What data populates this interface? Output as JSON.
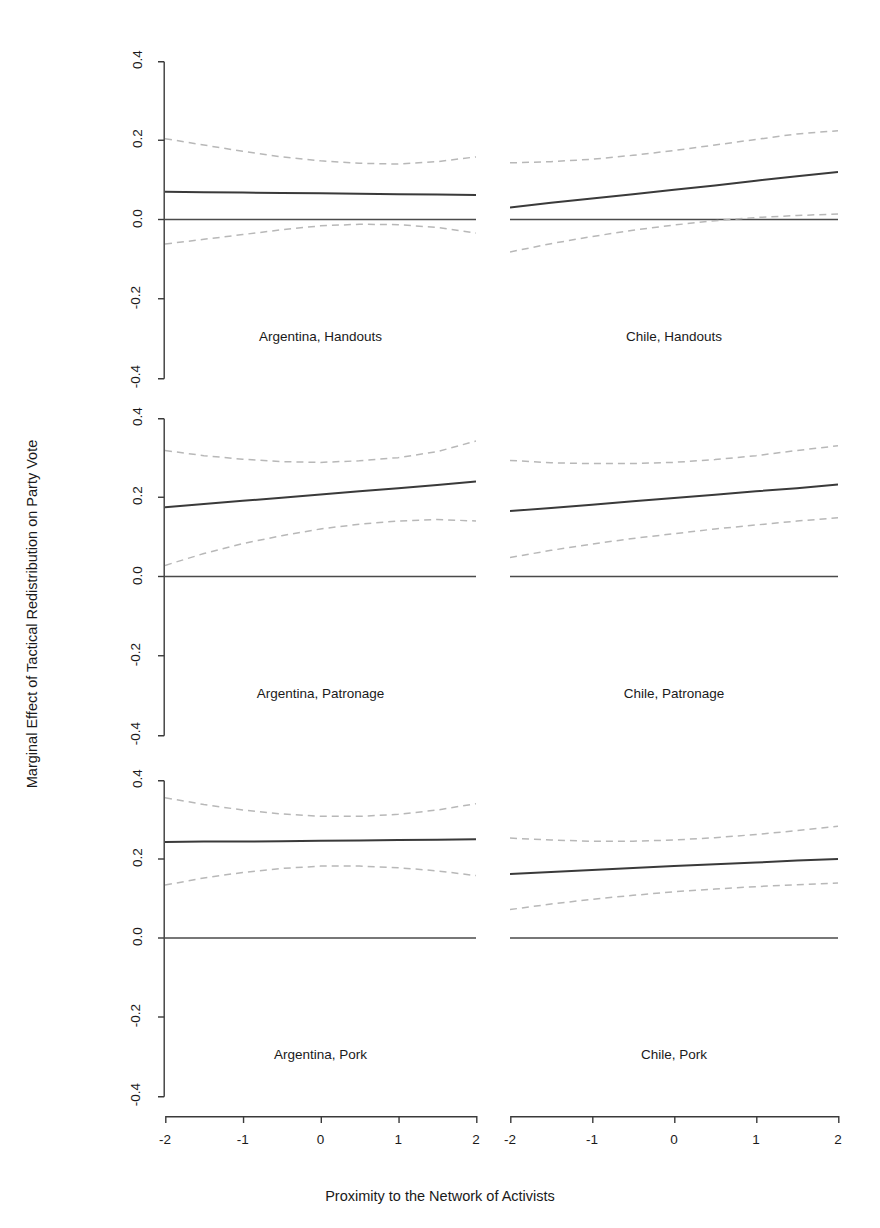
{
  "figure": {
    "clipped_top_text": "",
    "ylabel": "Marginal Effect of Tactical Redistribution on Party Vote",
    "xlabel": "Proximity to the Network of Activists"
  },
  "axes": {
    "y_tick_labels": [
      "0.4",
      "0.2",
      "0.0",
      "-0.2",
      "-0.4"
    ],
    "x_tick_labels": [
      "-2",
      "-1",
      "0",
      "1",
      "2"
    ]
  },
  "colors": {
    "estimate_line": "#3a3a3a",
    "ci_line": "#b8b8b8",
    "zero_line": "#4a4a4a",
    "axis": "#3a3a3a",
    "text": "#1a1a1a",
    "background": "#ffffff"
  },
  "chart_data": {
    "type": "line",
    "title": "",
    "xlabel": "Proximity to the Network of Activists",
    "ylabel": "Marginal Effect of Tactical Redistribution on Party Vote",
    "xlim": [
      -2,
      2
    ],
    "ylim": [
      -0.4,
      0.4
    ],
    "xticks": [
      -2,
      -1,
      0,
      1,
      2
    ],
    "yticks": [
      -0.4,
      -0.2,
      0.0,
      0.2,
      0.4
    ],
    "grid": false,
    "legend": "none",
    "layout": {
      "rows": 3,
      "cols": 2,
      "row_order": [
        "Handouts",
        "Patronage",
        "Pork"
      ],
      "col_order": [
        "Argentina",
        "Chile"
      ]
    },
    "reference_line": 0.0,
    "x": [
      -2,
      -1.5,
      -1,
      -0.5,
      0,
      0.5,
      1,
      1.5,
      2
    ],
    "panels": [
      {
        "label": "Argentina, Handouts",
        "country": "Argentina",
        "outcome": "Handouts",
        "row": 0,
        "col": 0,
        "series": [
          {
            "name": "Marginal effect",
            "style": "solid",
            "values": [
              0.07,
              0.069,
              0.068,
              0.067,
              0.066,
              0.065,
              0.064,
              0.063,
              0.062
            ]
          },
          {
            "name": "Upper 95% CI",
            "style": "dashed",
            "values": [
              0.204,
              0.188,
              0.172,
              0.158,
              0.148,
              0.142,
              0.14,
              0.146,
              0.158
            ]
          },
          {
            "name": "Lower 95% CI",
            "style": "dashed",
            "values": [
              -0.062,
              -0.05,
              -0.038,
              -0.026,
              -0.016,
              -0.012,
              -0.013,
              -0.02,
              -0.034
            ]
          }
        ]
      },
      {
        "label": "Chile, Handouts",
        "country": "Chile",
        "outcome": "Handouts",
        "row": 0,
        "col": 1,
        "series": [
          {
            "name": "Marginal effect",
            "style": "solid",
            "values": [
              0.03,
              0.042,
              0.053,
              0.064,
              0.075,
              0.086,
              0.098,
              0.109,
              0.12
            ]
          },
          {
            "name": "Upper 95% CI",
            "style": "dashed",
            "values": [
              0.143,
              0.146,
              0.152,
              0.162,
              0.174,
              0.188,
              0.202,
              0.216,
              0.224
            ]
          },
          {
            "name": "Lower 95% CI",
            "style": "dashed",
            "values": [
              -0.082,
              -0.061,
              -0.043,
              -0.027,
              -0.014,
              -0.003,
              0.005,
              0.01,
              0.014
            ]
          }
        ]
      },
      {
        "label": "Argentina, Patronage",
        "country": "Argentina",
        "outcome": "Patronage",
        "row": 1,
        "col": 0,
        "series": [
          {
            "name": "Marginal effect",
            "style": "solid",
            "values": [
              0.175,
              0.183,
              0.191,
              0.199,
              0.207,
              0.215,
              0.223,
              0.231,
              0.24
            ]
          },
          {
            "name": "Upper 95% CI",
            "style": "dashed",
            "values": [
              0.318,
              0.305,
              0.296,
              0.29,
              0.288,
              0.292,
              0.3,
              0.315,
              0.342
            ]
          },
          {
            "name": "Lower 95% CI",
            "style": "dashed",
            "values": [
              0.028,
              0.058,
              0.083,
              0.103,
              0.12,
              0.132,
              0.14,
              0.144,
              0.14
            ]
          }
        ]
      },
      {
        "label": "Chile, Patronage",
        "country": "Chile",
        "outcome": "Patronage",
        "row": 1,
        "col": 1,
        "series": [
          {
            "name": "Marginal effect",
            "style": "solid",
            "values": [
              0.165,
              0.173,
              0.181,
              0.19,
              0.198,
              0.206,
              0.215,
              0.223,
              0.232
            ]
          },
          {
            "name": "Upper 95% CI",
            "style": "dashed",
            "values": [
              0.293,
              0.287,
              0.285,
              0.285,
              0.288,
              0.295,
              0.305,
              0.318,
              0.33
            ]
          },
          {
            "name": "Lower 95% CI",
            "style": "dashed",
            "values": [
              0.048,
              0.066,
              0.082,
              0.096,
              0.108,
              0.12,
              0.13,
              0.14,
              0.148
            ]
          }
        ]
      },
      {
        "label": "Argentina, Pork",
        "country": "Argentina",
        "outcome": "Pork",
        "row": 2,
        "col": 0,
        "series": [
          {
            "name": "Marginal effect",
            "style": "solid",
            "values": [
              0.243,
              0.244,
              0.244,
              0.245,
              0.246,
              0.247,
              0.248,
              0.249,
              0.25
            ]
          },
          {
            "name": "Upper 95% CI",
            "style": "dashed",
            "values": [
              0.355,
              0.338,
              0.324,
              0.314,
              0.308,
              0.308,
              0.313,
              0.324,
              0.34
            ]
          },
          {
            "name": "Lower 95% CI",
            "style": "dashed",
            "values": [
              0.134,
              0.152,
              0.166,
              0.176,
              0.182,
              0.182,
              0.178,
              0.17,
              0.158
            ]
          }
        ]
      },
      {
        "label": "Chile, Pork",
        "country": "Chile",
        "outcome": "Pork",
        "row": 2,
        "col": 1,
        "series": [
          {
            "name": "Marginal effect",
            "style": "solid",
            "values": [
              0.162,
              0.167,
              0.172,
              0.177,
              0.182,
              0.187,
              0.191,
              0.196,
              0.2
            ]
          },
          {
            "name": "Upper 95% CI",
            "style": "dashed",
            "values": [
              0.253,
              0.248,
              0.245,
              0.245,
              0.248,
              0.254,
              0.262,
              0.272,
              0.283
            ]
          },
          {
            "name": "Lower 95% CI",
            "style": "dashed",
            "values": [
              0.072,
              0.086,
              0.098,
              0.108,
              0.117,
              0.124,
              0.13,
              0.135,
              0.139
            ]
          }
        ]
      }
    ]
  }
}
